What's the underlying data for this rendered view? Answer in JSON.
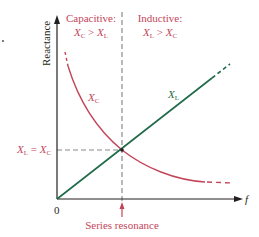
{
  "diagram": {
    "colors": {
      "axis": "#231f20",
      "capacitive": "#c4455a",
      "inductive": "#1f6b4a",
      "guide": "#8a8a8a",
      "background": "#ffffff"
    },
    "axes": {
      "y_label": "Reactance",
      "x_label": "f",
      "origin_label": "0"
    },
    "regions": {
      "capacitive": {
        "title": "Capacitive:",
        "relation": {
          "a": "X",
          "a_sub": "C",
          "op": " > ",
          "b": "X",
          "b_sub": "L"
        }
      },
      "inductive": {
        "title": "Inductive:",
        "relation": {
          "a": "X",
          "a_sub": "L",
          "op": " > ",
          "b": "X",
          "b_sub": "C"
        }
      }
    },
    "curves": {
      "xc": {
        "name": "X",
        "sub": "C",
        "shape": "hyperbola decreasing with f"
      },
      "xl": {
        "name": "X",
        "sub": "L",
        "shape": "straight line increasing with f"
      }
    },
    "equality_label": {
      "a": "X",
      "a_sub": "L",
      "op": " = ",
      "b": "X",
      "b_sub": "C"
    },
    "resonance_label": "Series resonance"
  }
}
